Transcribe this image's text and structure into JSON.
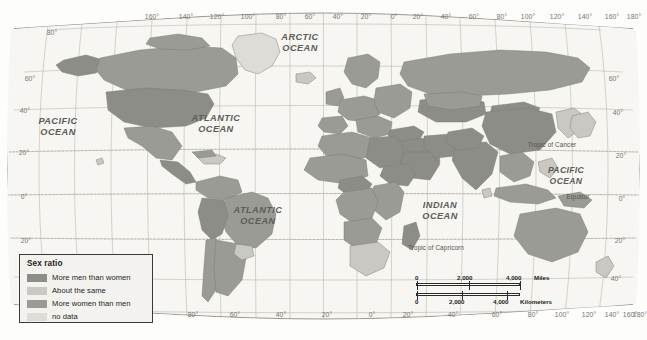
{
  "map": {
    "title": "World map of sex ratio by country",
    "projection": "Robinson",
    "background_color": "#fdfdfb",
    "ocean_color": "#f7f6f2",
    "graticule_color": "#b9b7ae",
    "border_color": "#8d8b84",
    "legend": {
      "title": "Sex ratio",
      "classes": [
        {
          "label": "More men than women",
          "color": "#8d8d88"
        },
        {
          "label": "About the same",
          "color": "#c9c8c2"
        },
        {
          "label": "More women than men",
          "color": "#9b9b95"
        },
        {
          "label": "no data",
          "color": "#dedcd6"
        }
      ]
    },
    "scalebar": {
      "miles": {
        "ticks": [
          "0",
          "2,000",
          "4,000"
        ],
        "unit": "Miles"
      },
      "kilometers": {
        "ticks": [
          "0",
          "2,000",
          "4,000"
        ],
        "unit": "Kilometers"
      }
    },
    "ocean_labels": [
      {
        "name": "arctic-ocean",
        "line1": "ARCTIC",
        "line2": "OCEAN",
        "x": 300,
        "y": 38
      },
      {
        "name": "pacific-ocean-west",
        "line1": "PACIFIC",
        "line2": "OCEAN",
        "x": 58,
        "y": 122
      },
      {
        "name": "atlantic-ocean-north",
        "line1": "ATLANTIC",
        "line2": "OCEAN",
        "x": 216,
        "y": 118
      },
      {
        "name": "atlantic-ocean-south",
        "line1": "ATLANTIC",
        "line2": "OCEAN",
        "x": 258,
        "y": 210
      },
      {
        "name": "indian-ocean",
        "line1": "INDIAN",
        "line2": "OCEAN",
        "x": 440,
        "y": 205
      },
      {
        "name": "pacific-ocean-east",
        "line1": "PACIFIC",
        "line2": "OCEAN",
        "x": 566,
        "y": 170
      }
    ],
    "reference_lines": [
      {
        "name": "tropic-of-cancer",
        "label": "Tropic of Cancer",
        "x": 552,
        "y": 144
      },
      {
        "name": "equator",
        "label": "Equator",
        "x": 578,
        "y": 196
      },
      {
        "name": "tropic-of-capricorn",
        "label": "Tropic of Capricorn",
        "x": 436,
        "y": 247
      }
    ],
    "longitude_labels_top": [
      {
        "text": "160°",
        "x": 152,
        "y": 16
      },
      {
        "text": "140°",
        "x": 186,
        "y": 16
      },
      {
        "text": "120°",
        "x": 217,
        "y": 16
      },
      {
        "text": "100°",
        "x": 248,
        "y": 16
      },
      {
        "text": "80°",
        "x": 281,
        "y": 16
      },
      {
        "text": "60°",
        "x": 310,
        "y": 16
      },
      {
        "text": "40°",
        "x": 338,
        "y": 16
      },
      {
        "text": "20°",
        "x": 366,
        "y": 16
      },
      {
        "text": "0°",
        "x": 394,
        "y": 16
      },
      {
        "text": "20°",
        "x": 418,
        "y": 16
      },
      {
        "text": "40°",
        "x": 446,
        "y": 16
      },
      {
        "text": "60°",
        "x": 474,
        "y": 16
      },
      {
        "text": "80°",
        "x": 502,
        "y": 16
      },
      {
        "text": "100°",
        "x": 528,
        "y": 16
      },
      {
        "text": "120°",
        "x": 557,
        "y": 16
      },
      {
        "text": "140°",
        "x": 585,
        "y": 16
      },
      {
        "text": "160°",
        "x": 612,
        "y": 16
      },
      {
        "text": "180°",
        "x": 634,
        "y": 16
      }
    ],
    "longitude_labels_bottom": [
      {
        "text": "80°",
        "x": 193,
        "y": 314
      },
      {
        "text": "60°",
        "x": 235,
        "y": 314
      },
      {
        "text": "40°",
        "x": 281,
        "y": 314
      },
      {
        "text": "20°",
        "x": 327,
        "y": 314
      },
      {
        "text": "0°",
        "x": 372,
        "y": 314
      },
      {
        "text": "20°",
        "x": 408,
        "y": 314
      },
      {
        "text": "40°",
        "x": 453,
        "y": 314
      },
      {
        "text": "60°",
        "x": 497,
        "y": 314
      },
      {
        "text": "80°",
        "x": 533,
        "y": 314
      },
      {
        "text": "100°",
        "x": 562,
        "y": 314
      },
      {
        "text": "120°",
        "x": 589,
        "y": 314
      },
      {
        "text": "140°",
        "x": 612,
        "y": 314
      },
      {
        "text": "160°",
        "x": 630,
        "y": 314
      },
      {
        "text": "180°",
        "x": 640,
        "y": 314
      }
    ],
    "latitude_labels_left": [
      {
        "text": "80°",
        "x": 52,
        "y": 32
      },
      {
        "text": "60°",
        "x": 30,
        "y": 78
      },
      {
        "text": "40°",
        "x": 25,
        "y": 110
      },
      {
        "text": "20°",
        "x": 24,
        "y": 152
      },
      {
        "text": "0°",
        "x": 24,
        "y": 196
      },
      {
        "text": "20°",
        "x": 26,
        "y": 240
      }
    ],
    "latitude_labels_right": [
      {
        "text": "60°",
        "x": 614,
        "y": 78
      },
      {
        "text": "40°",
        "x": 618,
        "y": 112
      },
      {
        "text": "20°",
        "x": 621,
        "y": 155
      },
      {
        "text": "0°",
        "x": 622,
        "y": 198
      },
      {
        "text": "20°",
        "x": 620,
        "y": 240
      },
      {
        "text": "40°",
        "x": 616,
        "y": 278
      }
    ]
  }
}
